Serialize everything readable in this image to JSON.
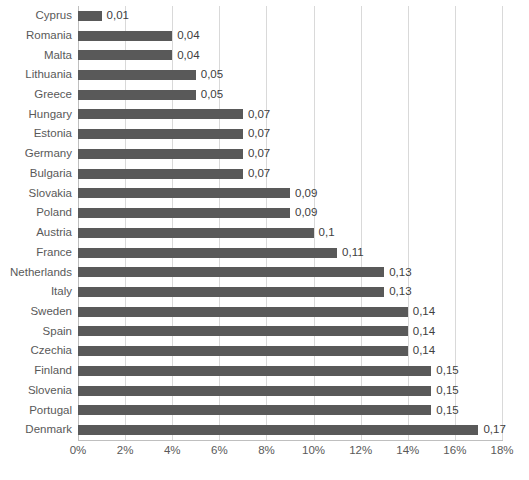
{
  "chart_data": {
    "type": "bar",
    "orientation": "horizontal",
    "title": "",
    "subtitle": "",
    "xlabel": "",
    "ylabel": "",
    "xlim": [
      0,
      0.18
    ],
    "grid": true,
    "legend": null,
    "legend_position": "none",
    "value_label_format": "comma-decimal",
    "axis_tick_format": "percent",
    "categories": [
      "Cyprus",
      "Romania",
      "Malta",
      "Lithuania",
      "Greece",
      "Hungary",
      "Estonia",
      "Germany",
      "Bulgaria",
      "Slovakia",
      "Poland",
      "Austria",
      "France",
      "Netherlands",
      "Italy",
      "Sweden",
      "Spain",
      "Czechia",
      "Finland",
      "Slovenia",
      "Portugal",
      "Denmark"
    ],
    "values": [
      0.01,
      0.04,
      0.04,
      0.05,
      0.05,
      0.07,
      0.07,
      0.07,
      0.07,
      0.09,
      0.09,
      0.1,
      0.11,
      0.13,
      0.13,
      0.14,
      0.14,
      0.14,
      0.15,
      0.15,
      0.15,
      0.17
    ],
    "value_labels": [
      "0,01",
      "0,04",
      "0,04",
      "0,05",
      "0,05",
      "0,07",
      "0,07",
      "0,07",
      "0,07",
      "0,09",
      "0,09",
      "0,1",
      "0,11",
      "0,13",
      "0,13",
      "0,14",
      "0,14",
      "0,14",
      "0,15",
      "0,15",
      "0,15",
      "0,17"
    ],
    "xticks": [
      0,
      0.02,
      0.04,
      0.06,
      0.08,
      0.1,
      0.12,
      0.14,
      0.16,
      0.18
    ],
    "xtick_labels": [
      "0%",
      "2%",
      "4%",
      "6%",
      "8%",
      "10%",
      "12%",
      "14%",
      "16%",
      "18%"
    ],
    "colors": {
      "bar": "#595959",
      "gridline": "#d9d9d9",
      "axis": "#bfbfbf",
      "label_text": "#595959",
      "value_text": "#404040",
      "background": "#ffffff"
    }
  }
}
